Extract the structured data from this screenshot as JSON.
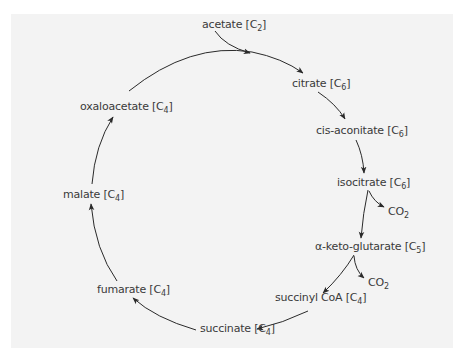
{
  "diagram": {
    "line_color": "#2a2a2a",
    "text_color": "#3a3a3a",
    "background": "#f3f3f3",
    "nodes": [
      {
        "id": "acetate",
        "name": "acetate",
        "carbons": "2",
        "x": 202,
        "y": 18
      },
      {
        "id": "citrate",
        "name": "citrate",
        "carbons": "6",
        "x": 292,
        "y": 77
      },
      {
        "id": "cis-aconitate",
        "name": "cis-aconitate",
        "carbons": "6",
        "x": 316,
        "y": 124
      },
      {
        "id": "isocitrate",
        "name": "isocitrate",
        "carbons": "6",
        "x": 337,
        "y": 176
      },
      {
        "id": "alpha-keto-glutarate",
        "name": "α-keto-glutarate",
        "carbons": "5",
        "x": 315,
        "y": 240
      },
      {
        "id": "succinyl-coa",
        "name": "succinyl CoA",
        "carbons": "4",
        "x": 275,
        "y": 291
      },
      {
        "id": "succinate",
        "name": "succinate",
        "carbons": "4",
        "x": 200,
        "y": 322
      },
      {
        "id": "fumarate",
        "name": "fumarate",
        "carbons": "4",
        "x": 97,
        "y": 283
      },
      {
        "id": "malate",
        "name": "malate",
        "carbons": "4",
        "x": 63,
        "y": 188
      },
      {
        "id": "oxaloacetate",
        "name": "oxaloacetate",
        "carbons": "4",
        "x": 80,
        "y": 100
      }
    ],
    "byproducts": [
      {
        "id": "co2-1",
        "label": "CO",
        "sub": "2",
        "x": 388,
        "y": 205
      },
      {
        "id": "co2-2",
        "label": "CO",
        "sub": "2",
        "x": 368,
        "y": 276
      }
    ],
    "carbon_symbol": "C"
  }
}
